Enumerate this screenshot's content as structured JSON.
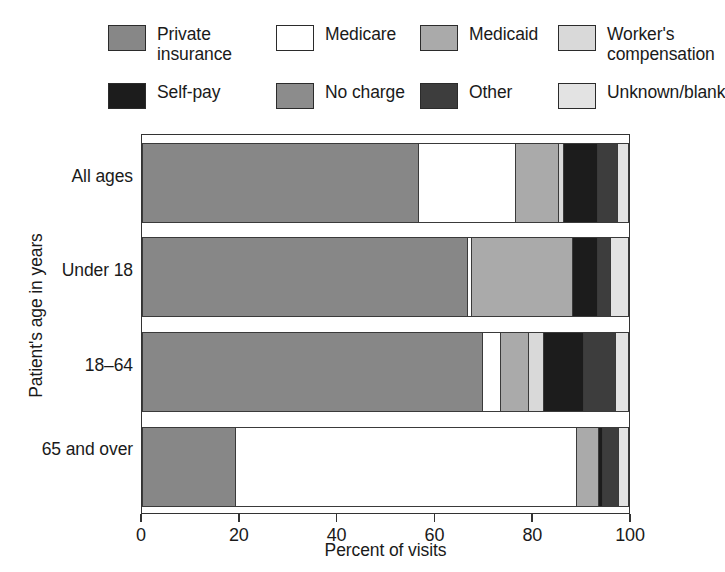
{
  "legend": {
    "rows": [
      [
        {
          "label": "Private\ninsurance",
          "key": "private_insurance",
          "color": "#878787"
        },
        {
          "label": "Medicare",
          "key": "medicare",
          "color": "#ffffff"
        },
        {
          "label": "Medicaid",
          "key": "medicaid",
          "color": "#aaaaaa"
        },
        {
          "label": "Worker's\ncompensation",
          "key": "workers_compensation",
          "color": "#d9d9d9"
        }
      ],
      [
        {
          "label": "Self-pay",
          "key": "self_pay",
          "color": "#1c1c1c"
        },
        {
          "label": "No charge",
          "key": "no_charge",
          "color": "#8c8c8c"
        },
        {
          "label": "Other",
          "key": "other",
          "color": "#3d3d3d"
        },
        {
          "label": "Unknown/blank",
          "key": "unknown_blank",
          "color": "#e3e3e3"
        }
      ]
    ]
  },
  "chart_data": {
    "type": "bar",
    "orientation": "horizontal",
    "stacked": true,
    "stack_total": 100,
    "title": "",
    "xlabel": "Percent of visits",
    "ylabel": "Patient's age in years",
    "xlim": [
      0,
      100
    ],
    "xticks": [
      0,
      20,
      40,
      60,
      80,
      100
    ],
    "xticklabels": [
      "0",
      "20",
      "40",
      "60",
      "80",
      "100"
    ],
    "grid": false,
    "legend_position": "top",
    "categories": [
      "All ages",
      "Under 18",
      "18–64",
      "65 and over"
    ],
    "series": [
      {
        "name": "Private insurance",
        "color": "#878787",
        "values": [
          56.8,
          67.0,
          70.0,
          19.3
        ]
      },
      {
        "name": "Medicare",
        "color": "#ffffff",
        "values": [
          20.0,
          0.8,
          3.8,
          70.0
        ]
      },
      {
        "name": "Medicaid",
        "color": "#aaaaaa",
        "values": [
          8.8,
          20.8,
          5.7,
          4.5
        ]
      },
      {
        "name": "Worker's compensation",
        "color": "#d9d9d9",
        "values": [
          1.0,
          0.0,
          3.1,
          0.0
        ]
      },
      {
        "name": "Self-pay",
        "color": "#1c1c1c",
        "values": [
          7.1,
          5.1,
          8.2,
          0.8
        ]
      },
      {
        "name": "No charge",
        "color": "#8c8c8c",
        "values": [
          0.0,
          0.0,
          0.0,
          0.0
        ]
      },
      {
        "name": "Other",
        "color": "#3d3d3d",
        "values": [
          4.1,
          2.7,
          6.5,
          3.3
        ]
      },
      {
        "name": "Unknown/blank",
        "color": "#e3e3e3",
        "values": [
          2.2,
          3.6,
          2.7,
          2.1
        ]
      }
    ]
  }
}
